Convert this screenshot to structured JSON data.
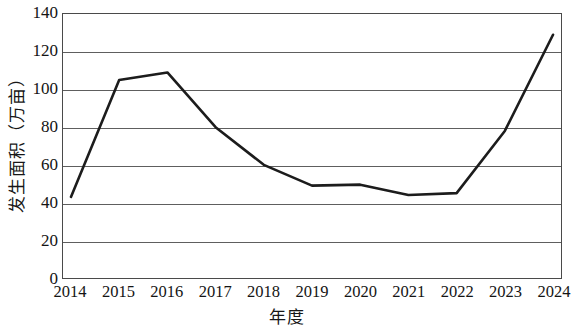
{
  "chart_data": {
    "type": "line",
    "title": "",
    "subtitle": "",
    "xlabel": "年度",
    "ylabel": "发生面积（万亩）",
    "categories": [
      "2014",
      "2015",
      "2016",
      "2017",
      "2018",
      "2019",
      "2020",
      "2021",
      "2022",
      "2023",
      "2024"
    ],
    "x": [
      2014,
      2015,
      2016,
      2017,
      2018,
      2019,
      2020,
      2021,
      2022,
      2023,
      2024
    ],
    "series": [
      {
        "name": "发生面积",
        "values": [
          43,
          105,
          109,
          80,
          60,
          49,
          49.5,
          44,
          45,
          78,
          129
        ],
        "color": "#1c1c1c",
        "line_width": 2.6,
        "markers": false
      }
    ],
    "values": [
      43,
      105,
      109,
      80,
      60,
      49,
      49.5,
      44,
      45,
      78,
      129
    ],
    "ylim": [
      0,
      140
    ],
    "ytick_values": [
      0,
      20,
      40,
      60,
      80,
      100,
      120,
      140
    ],
    "ytick_labels": [
      "0",
      "20",
      "40",
      "60",
      "80",
      "100",
      "120",
      "140"
    ],
    "xtick_labels": [
      "2014",
      "2015",
      "2016",
      "2017",
      "2018",
      "2019",
      "2020",
      "2021",
      "2022",
      "2023",
      "2024"
    ],
    "grid": {
      "horizontal": true,
      "vertical": false,
      "color": "#5e5e5e"
    },
    "legend": {
      "visible": false,
      "position": "none",
      "entries": []
    },
    "frame": {
      "visible": true,
      "color": "#4a4a4a"
    },
    "annotations": []
  },
  "axes": {
    "y_title": "发生面积（万亩）",
    "x_title": "年度"
  }
}
